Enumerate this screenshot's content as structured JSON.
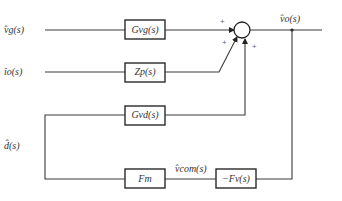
{
  "diagram": {
    "type": "block-diagram",
    "inputs": {
      "vg": "v̂g(s)",
      "io": "îo(s)",
      "d": "d̂(s)"
    },
    "output": "v̂o(s)",
    "blocks": {
      "gvg": "Gvg(s)",
      "zp": "Zp(s)",
      "gvd": "Gvd(s)",
      "fm": "Fm",
      "fv": "−Fv(s)"
    },
    "signals": {
      "vcom": "v̂com(s)"
    },
    "summing_junction": {
      "signs": [
        "+",
        "+",
        "+"
      ]
    },
    "colors": {
      "line": "#3a3a3a",
      "background": "#ffffff"
    }
  }
}
